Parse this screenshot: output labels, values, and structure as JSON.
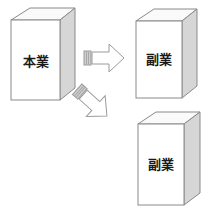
{
  "diagram": {
    "title": "",
    "background_color": "#ffffff",
    "box_front_color": "#ffffff",
    "box_top_color": "#fafafa",
    "box_side_color": "#d6d6d6",
    "outline_color": "#8a8a8a",
    "label_color": "#1a1a1a",
    "arrow_fill_color": "#ffffff",
    "arrow_outline_color": "#9a9a9a",
    "boxes": [
      {
        "id": "main-business",
        "label": "本業",
        "position": "left",
        "label_x": 36,
        "label_y": 62
      },
      {
        "id": "side-business-top",
        "label": "副業",
        "position": "top-right",
        "label_x": 160,
        "label_y": 60
      },
      {
        "id": "side-business-bottom",
        "label": "副業",
        "position": "bottom-right",
        "label_x": 162,
        "label_y": 163
      }
    ],
    "arrows": [
      {
        "id": "arrow-horizontal",
        "direction": "right",
        "from": "main-business",
        "to": "side-business-top",
        "style": "block-arrow-striped-tail"
      },
      {
        "id": "arrow-diagonal",
        "direction": "down-right",
        "from": "main-business",
        "to": "side-business-bottom",
        "style": "block-arrow-striped-tail"
      }
    ]
  }
}
